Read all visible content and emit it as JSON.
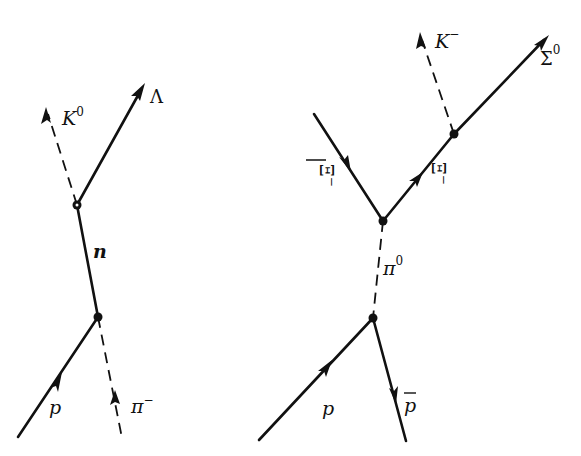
{
  "diagrams": [
    {
      "name": "left-diagram",
      "reaction": "p + π⁻ → n → Λ + K⁰",
      "particles": {
        "K0": {
          "symbol": "K",
          "superscript": "0",
          "line": "dashed"
        },
        "Lambda": {
          "symbol": "Λ",
          "line": "solid"
        },
        "n": {
          "symbol": "n",
          "line": "solid"
        },
        "p": {
          "symbol": "p",
          "line": "solid"
        },
        "pi_minus": {
          "symbol": "π",
          "superscript": "−",
          "line": "dashed"
        }
      }
    },
    {
      "name": "right-diagram",
      "reaction": "p + p̄ → π⁰ → Ξ̄ + Ξ⁻; Ξ⁻ → Σ⁰ + K⁻",
      "particles": {
        "K_minus": {
          "symbol": "K",
          "superscript": "−",
          "line": "dashed"
        },
        "Sigma0": {
          "symbol": "Σ",
          "superscript": "0",
          "line": "solid"
        },
        "Xi_bar": {
          "symbol": "Ξ",
          "overbar": true,
          "superscript": "−",
          "line": "solid"
        },
        "Xi_minus": {
          "symbol": "Ξ",
          "superscript": "−",
          "line": "solid"
        },
        "pi0": {
          "symbol": "π",
          "superscript": "0",
          "line": "dashed"
        },
        "p": {
          "symbol": "p",
          "line": "solid"
        },
        "p_bar": {
          "symbol": "p",
          "overbar": true,
          "line": "solid"
        }
      }
    }
  ],
  "colors": {
    "ink": "#111111",
    "background": "#ffffff"
  }
}
